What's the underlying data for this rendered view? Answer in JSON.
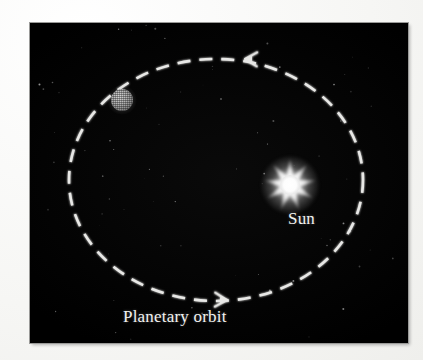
{
  "figure": {
    "background_color": "#040404",
    "panel": {
      "x": 30,
      "y": 23,
      "width": 378,
      "height": 320
    }
  },
  "labels": {
    "sun": "Sun",
    "orbit": "Planetary orbit"
  },
  "chart_data": {
    "type": "diagram",
    "title": "Planetary orbit",
    "sky_color": "#040404",
    "stroke_color": "#e8e8e6",
    "orbit": {
      "shape": "ellipse",
      "center": {
        "x": 186,
        "y": 157
      },
      "radius_x": 147,
      "radius_y": 121,
      "dash_pattern": "13 9",
      "stroke_width": 2.6,
      "direction": "counterclockwise"
    },
    "arrows": [
      {
        "name": "top-arrow",
        "x": 216,
        "y": 36,
        "points": "left",
        "angle_deg": 182
      },
      {
        "name": "bottom-arrow",
        "x": 196,
        "y": 277,
        "points": "right",
        "angle_deg": 2
      }
    ],
    "bodies": [
      {
        "name": "sun",
        "label": "Sun",
        "x": 260,
        "y": 162,
        "core_radius": 10,
        "ray_count": 9,
        "outer_radius": 26,
        "color": "#ffffff",
        "on_orbit": false
      },
      {
        "name": "planet",
        "label": "",
        "x": 92,
        "y": 77,
        "radius": 11,
        "color": "#9e9e9e",
        "on_orbit": true
      }
    ],
    "starfield": {
      "count": 78,
      "color": "#bdbdbd",
      "max_size_px": 2
    }
  }
}
